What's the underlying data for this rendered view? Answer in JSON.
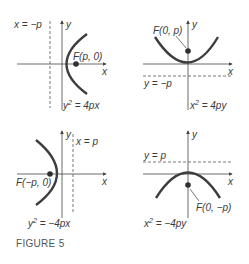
{
  "figure": {
    "caption": "FIGURE 5",
    "colors": {
      "axis": "#444444",
      "curve": "#3d3d3d",
      "focus": "#2f2f2f",
      "directrix": "#555555",
      "text": "#3a3a3a"
    },
    "panels": [
      {
        "id": "right-opening",
        "x_axis_label": "x",
        "y_axis_label": "y",
        "directrix_label": "x = −p",
        "focus_label": "F(p, 0)",
        "equation": {
          "lhs_base": "y",
          "lhs_exp": "2",
          "rhs": " = 4px"
        }
      },
      {
        "id": "up-opening",
        "x_axis_label": "x",
        "y_axis_label": "y",
        "directrix_label": "y = −p",
        "focus_label": "F(0, p)",
        "equation": {
          "lhs_base": "x",
          "lhs_exp": "2",
          "rhs": " = 4py"
        }
      },
      {
        "id": "left-opening",
        "x_axis_label": "x",
        "y_axis_label": "y",
        "directrix_label": "x = p",
        "focus_label": "F(−p, 0)",
        "equation": {
          "lhs_base": "y",
          "lhs_exp": "2",
          "rhs": " = −4px"
        }
      },
      {
        "id": "down-opening",
        "x_axis_label": "x",
        "y_axis_label": "y",
        "directrix_label": "y = p",
        "focus_label": "F(0, −p)",
        "equation": {
          "lhs_base": "x",
          "lhs_exp": "2",
          "rhs": " = −4py"
        }
      }
    ]
  }
}
